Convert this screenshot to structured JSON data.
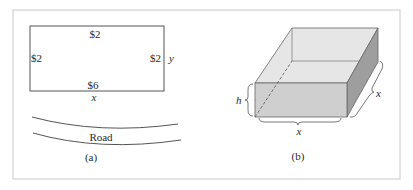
{
  "figure": {
    "panel_a": {
      "caption": "(a)",
      "rectangle_labels": {
        "top": "$2",
        "left": "$2",
        "right": "$2",
        "bottom": "$6"
      },
      "dimension_labels": {
        "width": "x",
        "height": "y"
      },
      "road_label": "Road"
    },
    "panel_b": {
      "caption": "(b)",
      "dimension_labels": {
        "height": "h",
        "front_width": "x",
        "depth": "x"
      }
    },
    "colors": {
      "frame": "#c8c8c8",
      "line": "#555555",
      "box_top": "#e6e6e6",
      "box_front": "#cfcfcf",
      "box_side": "#9e9e9e"
    }
  }
}
